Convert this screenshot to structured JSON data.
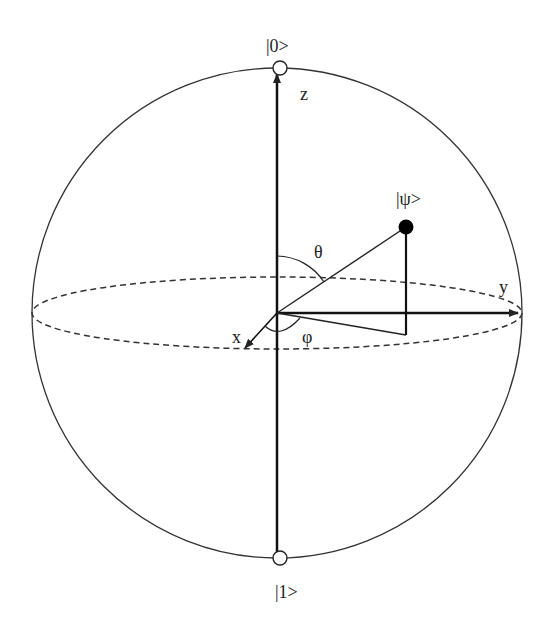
{
  "diagram": {
    "labels": {
      "north_state": "|0>",
      "south_state": "|1>",
      "state": "|ψ>",
      "z_axis": "z",
      "y_axis": "y",
      "x_axis": "x",
      "theta": "θ",
      "phi": "φ"
    },
    "colors": {
      "stroke": "#222222",
      "background": "#ffffff"
    }
  }
}
